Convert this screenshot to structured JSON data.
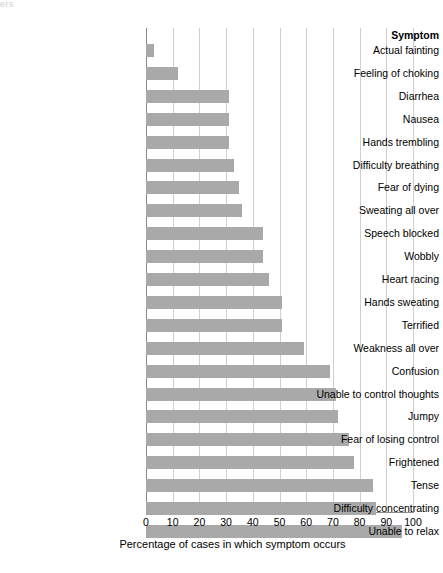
{
  "artifact": {
    "text": "ers"
  },
  "axis": {
    "category_header": "Symptom",
    "xlabel": "Percentage of cases in which symptom occurs",
    "xticks": [
      "0",
      "10",
      "20",
      "30",
      "40",
      "50",
      "60",
      "70",
      "80",
      "90",
      "100"
    ]
  },
  "colors": {
    "bar": "#a9a9a9",
    "gridline": "#cfcfcf",
    "axis": "#8a8a8a",
    "text": "#000000",
    "background": "#ffffff"
  },
  "chart_data": {
    "type": "bar",
    "orientation": "horizontal",
    "title": "",
    "subtitle": "",
    "xlabel": "Percentage of cases in which symptom occurs",
    "ylabel": "Symptom",
    "xlim": [
      0,
      100
    ],
    "grid": "vertical gridlines at every 10 units",
    "legend": "none",
    "categories": [
      "Actual fainting",
      "Feeling of choking",
      "Diarrhea",
      "Nausea",
      "Hands trembling",
      "Difficulty breathing",
      "Fear of dying",
      "Sweating all over",
      "Speech blocked",
      "Wobbly",
      "Heart racing",
      "Hands sweating",
      "Terrified",
      "Weakness all over",
      "Confusion",
      "Unable to control thoughts",
      "Jumpy",
      "Fear of losing control",
      "Frightened",
      "Tense",
      "Difficulty concentrating",
      "Unable to relax"
    ],
    "values": [
      3,
      12,
      31,
      31,
      31,
      33,
      35,
      36,
      44,
      44,
      46,
      51,
      51,
      59,
      69,
      71,
      72,
      76,
      78,
      85,
      86,
      96
    ]
  }
}
